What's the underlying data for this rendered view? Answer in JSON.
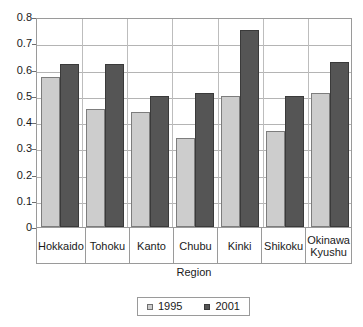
{
  "chart_data": {
    "type": "bar",
    "title": "",
    "xlabel": "Region",
    "ylabel": "",
    "ylim": [
      0,
      0.8
    ],
    "ytick_values": [
      0.8,
      0.7,
      0.6,
      0.5,
      0.4,
      0.3,
      0.2,
      0.1,
      0
    ],
    "ytick_labels": [
      "0.8",
      "0.7",
      "0.6",
      "0.5",
      "0.4",
      "0.3",
      "0.2",
      "0.1",
      "0"
    ],
    "grid": true,
    "grid_axis": "y",
    "legend_position": "bottom",
    "categories": [
      "Hokkaido",
      "Tohoku",
      "Kanto",
      "Chubu",
      "Kinki",
      "Shikoku",
      "Okinawa\nKyushu"
    ],
    "series": [
      {
        "name": "1995",
        "color": "#cdcdcd",
        "values": [
          0.57,
          0.45,
          0.44,
          0.34,
          0.5,
          0.365,
          0.51
        ]
      },
      {
        "name": "2001",
        "color": "#555555",
        "values": [
          0.62,
          0.62,
          0.5,
          0.51,
          0.75,
          0.5,
          0.63
        ]
      }
    ]
  },
  "legend": {
    "entries": [
      {
        "label": "1995",
        "swatch": "legend-swatch-1995"
      },
      {
        "label": "2001",
        "swatch": "legend-swatch-2001"
      }
    ]
  }
}
